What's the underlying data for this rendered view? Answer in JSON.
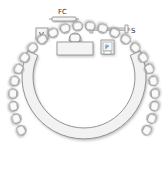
{
  "diagram": {
    "labels": {
      "flip_chart": "FC",
      "screen": "S",
      "video": "V",
      "podium": "P"
    },
    "arc": {
      "cx": 84,
      "cy": 97,
      "outer_r": 62,
      "inner_r": 51,
      "start_deg": 205,
      "end_deg": -25
    },
    "chairs": {
      "count": 24,
      "radius": 71
    },
    "head_table": {
      "chairs": 1
    },
    "colors": {
      "stroke": "#8a8a8a",
      "fill": "#f2f2f2",
      "shadow": "#cfcfcf",
      "text": "#333333"
    }
  }
}
